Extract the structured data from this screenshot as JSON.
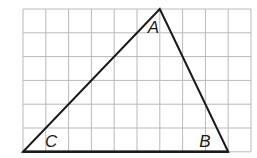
{
  "diagram": {
    "type": "triangle-on-grid",
    "grid": {
      "columns": 10,
      "rows": 6,
      "origin": [
        23,
        9
      ],
      "cell_width": 22.8,
      "cell_height": 23.8,
      "line_color": "#b9b9b9"
    },
    "vertices": {
      "A": {
        "label": "A",
        "grid": [
          6,
          0
        ]
      },
      "B": {
        "label": "B",
        "grid": [
          9,
          6
        ]
      },
      "C": {
        "label": "C",
        "grid": [
          0,
          6
        ]
      }
    },
    "stroke_color": "#1a1a1a"
  }
}
